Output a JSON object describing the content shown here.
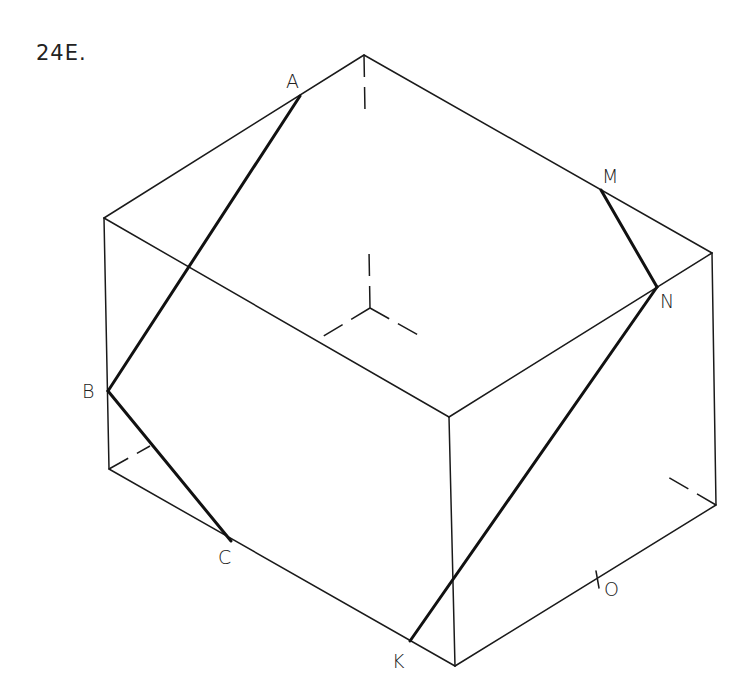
{
  "problem": {
    "number": "24E."
  },
  "labels": {
    "A": "A",
    "B": "B",
    "C": "C",
    "K": "K",
    "M": "M",
    "N": "N",
    "O": "O"
  },
  "colors": {
    "line": "#1a1a1a",
    "background": "#ffffff"
  },
  "figure": {
    "type": "cube-section-isometric",
    "vertices": {
      "top_back": [
        364,
        55
      ],
      "top_left": [
        104,
        218
      ],
      "top_right": [
        712,
        253
      ],
      "top_front": [
        449,
        417
      ],
      "bottom_left": [
        109,
        469
      ],
      "bottom_front": [
        455,
        666
      ],
      "bottom_right": [
        716,
        505
      ],
      "hidden_back": [
        370,
        308
      ]
    },
    "points": {
      "A": [
        300,
        96
      ],
      "B": [
        108,
        391
      ],
      "C": [
        231,
        541
      ],
      "K": [
        410,
        641
      ],
      "M": [
        601,
        190
      ],
      "N": [
        657,
        287
      ],
      "O": [
        598,
        583
      ]
    },
    "section_segments": [
      [
        "A",
        "B"
      ],
      [
        "B",
        "C"
      ],
      [
        "M",
        "N"
      ],
      [
        "N",
        "K"
      ]
    ]
  }
}
